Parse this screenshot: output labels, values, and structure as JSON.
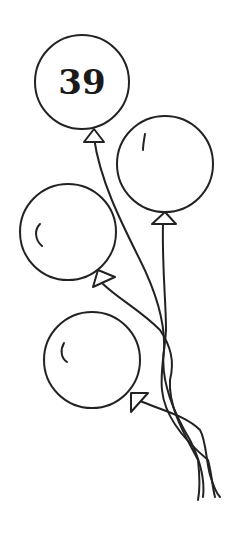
{
  "illustration": {
    "description": "Line drawing of four balloons with strings tied together",
    "numbered_balloon": {
      "label": "39"
    },
    "balloons": [
      {
        "name": "balloon-39",
        "cx": 82,
        "cy": 82,
        "r": 47,
        "label": "39"
      },
      {
        "name": "balloon-top-right",
        "cx": 165,
        "cy": 164,
        "r": 48
      },
      {
        "name": "balloon-middle-left",
        "cx": 68,
        "cy": 232,
        "r": 48
      },
      {
        "name": "balloon-bottom-left",
        "cx": 92,
        "cy": 360,
        "r": 48
      }
    ],
    "colors": {
      "ink": "#222222",
      "background": "#ffffff"
    }
  }
}
